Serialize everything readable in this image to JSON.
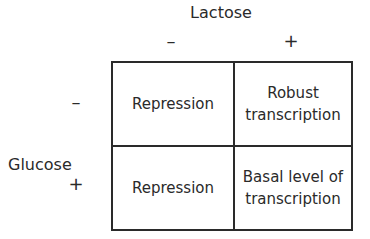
{
  "diagram": {
    "column_header": {
      "title": "Lactose",
      "signs": [
        "–",
        "+"
      ]
    },
    "row_header": {
      "title": "Glucose",
      "signs": [
        "–",
        "+"
      ]
    },
    "cells": [
      [
        "Repression",
        "Robust transcription"
      ],
      [
        "Repression",
        "Basal level of transcription"
      ]
    ],
    "cell_lines": [
      [
        [
          "Repression"
        ],
        [
          "Robust",
          "transcription"
        ]
      ],
      [
        [
          "Repression"
        ],
        [
          "Basal level of",
          "transcription"
        ]
      ]
    ]
  }
}
